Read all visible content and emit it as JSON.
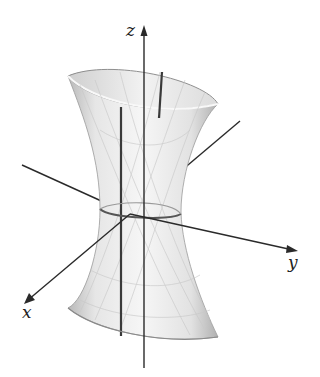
{
  "figure": {
    "surface": "hyperboloid of one sheet",
    "axes": {
      "z_label": "z",
      "y_label": "y",
      "x_label": "x"
    },
    "colors": {
      "axis": "#2a2a2a",
      "surface_fill": "#eeeeee",
      "surface_shade": "#bdbdbd",
      "ruling": "#3a3a3a",
      "grid_line": "#c8c8c8"
    }
  }
}
